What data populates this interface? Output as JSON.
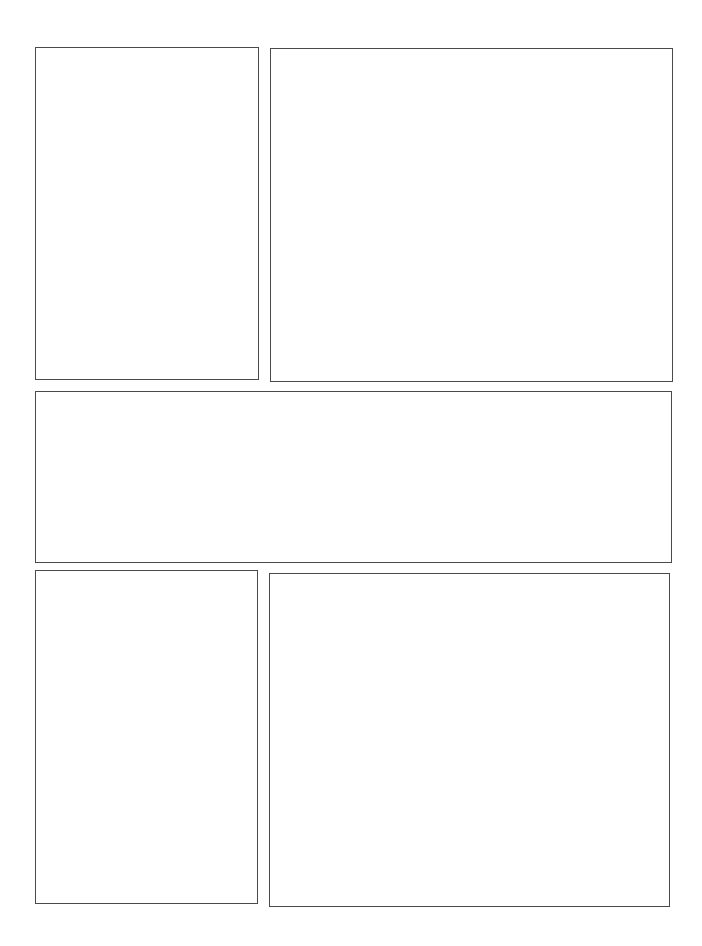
{
  "page": {
    "type": "comic-panel-template",
    "background_color": "#ffffff",
    "border_color": "#4a4a4a",
    "panel_count": 5
  },
  "panels": [
    {
      "id": "panel-1",
      "row": 1,
      "position": "left",
      "caption": ""
    },
    {
      "id": "panel-2",
      "row": 1,
      "position": "right",
      "caption": ""
    },
    {
      "id": "panel-3",
      "row": 2,
      "position": "full-width",
      "caption": ""
    },
    {
      "id": "panel-4",
      "row": 3,
      "position": "left",
      "caption": ""
    },
    {
      "id": "panel-5",
      "row": 3,
      "position": "right",
      "caption": ""
    }
  ]
}
